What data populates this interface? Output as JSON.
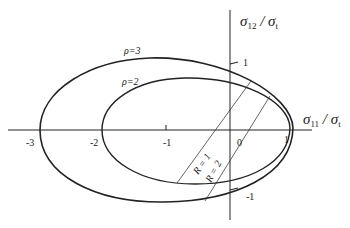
{
  "diagram": {
    "axes": {
      "x_label": {
        "main": "σ",
        "sub": "11",
        "div": " / ",
        "den": "σ",
        "den_sub": "t"
      },
      "y_label": {
        "main": "σ",
        "sub": "12",
        "div": " / ",
        "den": "σ",
        "den_sub": "t"
      },
      "x_ticks": [
        "-3",
        "-2",
        "-1",
        "0",
        "1"
      ],
      "y_ticks": [
        "1",
        "-1"
      ]
    },
    "curves": [
      {
        "label": "ρ=3"
      },
      {
        "label": "ρ=2"
      }
    ],
    "lines": [
      {
        "label": "R = 1"
      },
      {
        "label": "R = 2"
      }
    ],
    "colors": {
      "stroke": "#222222",
      "background": "#ffffff"
    }
  }
}
